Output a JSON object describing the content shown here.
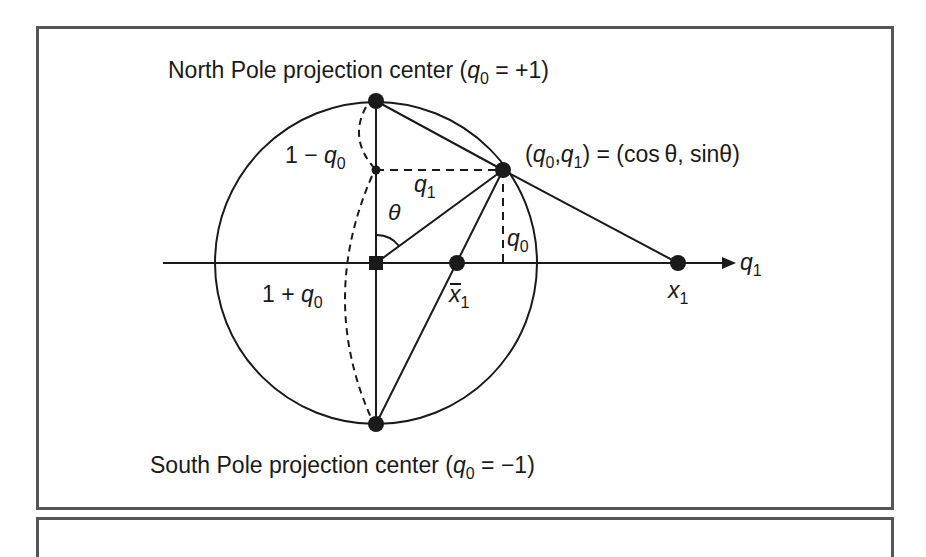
{
  "figure": {
    "north_label": {
      "prefix": "North Pole projection center (",
      "var": "q",
      "sub": "0",
      "suffix": " = +1)"
    },
    "south_label": {
      "prefix": "South Pole projection center (",
      "var": "q",
      "sub": "0",
      "suffix": " = −1)"
    },
    "point_label": {
      "open": "(",
      "v0": "q",
      "s0": "0",
      "comma": ",",
      "v1": "q",
      "s1": "1",
      "rest": ") = (cos θ, sinθ)"
    },
    "one_minus": {
      "prefix": "1 − ",
      "var": "q",
      "sub": "0"
    },
    "one_plus": {
      "prefix": "1 + ",
      "var": "q",
      "sub": "0"
    },
    "q1_mid": {
      "var": "q",
      "sub": "1"
    },
    "q0_vert": {
      "var": "q",
      "sub": "0"
    },
    "theta": "θ",
    "axis_label": {
      "var": "q",
      "sub": "1"
    },
    "xbar_label": {
      "var": "x",
      "sub": "1",
      "bar": "¯"
    },
    "x1_label": {
      "var": "x",
      "sub": "1"
    }
  },
  "colors": {
    "ink": "#1a1a1a",
    "frame": "#555555"
  }
}
